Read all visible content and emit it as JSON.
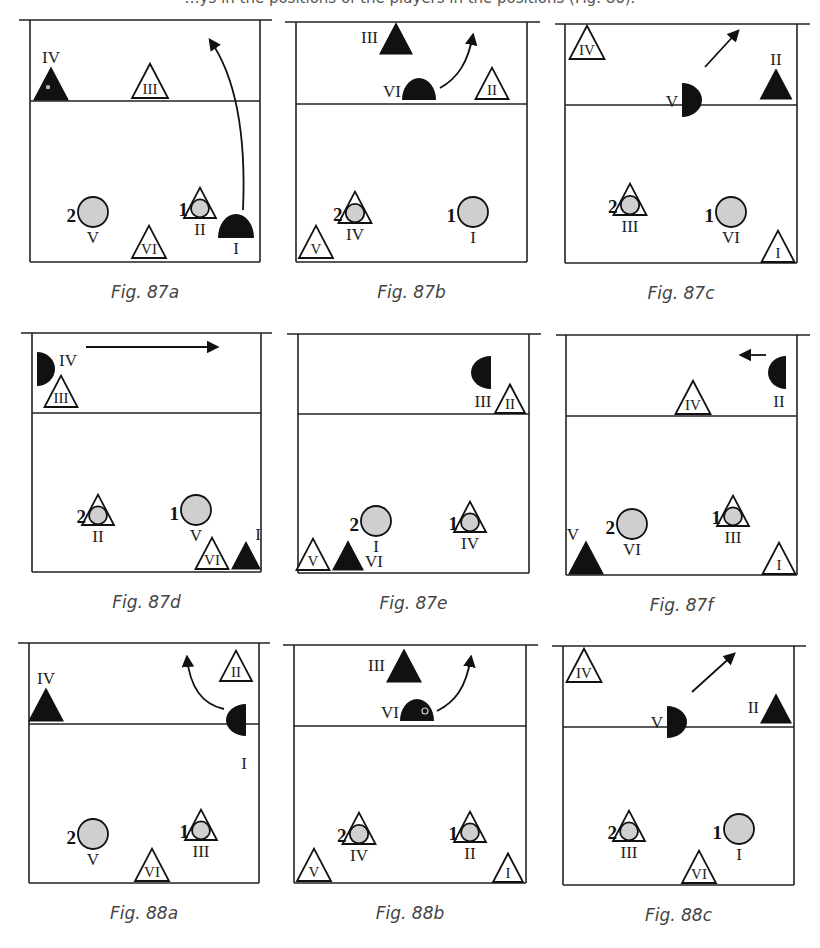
{
  "top_text": "…ys in the positions of the players in the positions (Fig. 86).",
  "colors": {
    "line": "#222222",
    "solid": "#111111",
    "ball": "#cfcfcf",
    "caption": "#444444"
  },
  "figures": [
    {
      "id": "87a",
      "caption": "Fig. 87a",
      "frame": {
        "x1": 30,
        "x2": 260,
        "top": 20,
        "net": 101,
        "bottom": 262,
        "ext_l": 19,
        "ext_r": 272
      },
      "items": [
        {
          "type": "tri-solid",
          "x": 51,
          "y": 100,
          "size": 34,
          "label": "IV",
          "label_pos": "above",
          "dot": true
        },
        {
          "type": "tri-open",
          "x": 150,
          "y": 98,
          "size": 36,
          "label": "III",
          "label_pos": "inside"
        },
        {
          "type": "ball",
          "x": 93,
          "y": 212,
          "r": 15,
          "num": "2",
          "label": "V"
        },
        {
          "type": "tri-open",
          "x": 149,
          "y": 258,
          "size": 34,
          "label": "VI",
          "label_pos": "inside"
        },
        {
          "type": "tri-ball",
          "x": 200,
          "y": 218,
          "size": 32,
          "num": "1",
          "label": "II"
        },
        {
          "type": "dome-up",
          "x": 236,
          "y": 238,
          "w": 36,
          "h": 24,
          "label": "I",
          "label_pos": "below"
        }
      ],
      "arrows": [
        {
          "d": "M243,210 C246,140 238,80 210,40",
          "head": [
            210,
            40
          ]
        }
      ]
    },
    {
      "id": "87b",
      "caption": "Fig. 87b",
      "frame": {
        "x1": 296,
        "x2": 527,
        "top": 22,
        "net": 104,
        "bottom": 262,
        "ext_l": 285,
        "ext_r": 540
      },
      "items": [
        {
          "type": "tri-solid",
          "x": 396,
          "y": 54,
          "size": 32,
          "label": "III",
          "label_pos": "left"
        },
        {
          "type": "dome-up",
          "x": 419,
          "y": 100,
          "w": 34,
          "h": 22,
          "label": "VI",
          "label_pos": "left"
        },
        {
          "type": "tri-open",
          "x": 492,
          "y": 99,
          "size": 33,
          "label": "II",
          "label_pos": "inside"
        },
        {
          "type": "tri-ball",
          "x": 355,
          "y": 223,
          "size": 33,
          "num": "2",
          "label": "IV"
        },
        {
          "type": "ball",
          "x": 473,
          "y": 212,
          "r": 15,
          "num": "1",
          "label": "I"
        },
        {
          "type": "tri-open",
          "x": 316,
          "y": 258,
          "size": 34,
          "label": "V",
          "label_pos": "inside"
        }
      ],
      "arrows": [
        {
          "d": "M440,88 C458,78 468,62 473,35",
          "head": [
            473,
            35
          ]
        }
      ]
    },
    {
      "id": "87c",
      "caption": "Fig. 87c",
      "frame": {
        "x1": 565,
        "x2": 797,
        "top": 24,
        "net": 105,
        "bottom": 263,
        "ext_l": 555,
        "ext_r": 810
      },
      "items": [
        {
          "type": "tri-open",
          "x": 587,
          "y": 59,
          "size": 35,
          "label": "IV",
          "label_pos": "inside"
        },
        {
          "type": "dome-right",
          "x": 682,
          "y": 83,
          "w": 20,
          "h": 34,
          "label": "V",
          "label_pos": "left"
        },
        {
          "type": "tri-solid",
          "x": 776,
          "y": 99,
          "size": 31,
          "label": "II",
          "label_pos": "above"
        },
        {
          "type": "tri-ball",
          "x": 630,
          "y": 215,
          "size": 33,
          "num": "2",
          "label": "III"
        },
        {
          "type": "ball",
          "x": 731,
          "y": 212,
          "r": 15,
          "num": "1",
          "label": "VI"
        },
        {
          "type": "tri-open",
          "x": 778,
          "y": 262,
          "size": 33,
          "label": "I",
          "label_pos": "inside"
        }
      ],
      "arrows": [
        {
          "d": "M705,67 L738,31",
          "head": [
            738,
            31
          ]
        }
      ]
    },
    {
      "id": "87d",
      "caption": "Fig. 87d",
      "frame": {
        "x1": 32,
        "x2": 261,
        "top": 333,
        "net": 413,
        "bottom": 572,
        "ext_l": 21,
        "ext_r": 272
      },
      "items": [
        {
          "type": "dome-right",
          "x": 37,
          "y": 352,
          "w": 18,
          "h": 34,
          "label": "IV",
          "label_pos": "right"
        },
        {
          "type": "tri-open",
          "x": 61,
          "y": 407,
          "size": 33,
          "label": "III",
          "label_pos": "inside"
        },
        {
          "type": "tri-ball",
          "x": 98,
          "y": 525,
          "size": 32,
          "num": "2",
          "label": "II"
        },
        {
          "type": "ball",
          "x": 196,
          "y": 510,
          "r": 15,
          "num": "1",
          "label": "V"
        },
        {
          "type": "tri-open",
          "x": 212,
          "y": 569,
          "size": 33,
          "label": "VI",
          "label_pos": "inside"
        },
        {
          "type": "tri-solid",
          "x": 246,
          "y": 569,
          "size": 28,
          "label": "I",
          "label_pos": "above-right"
        }
      ],
      "arrows": [
        {
          "d": "M86,347 L217,347",
          "head": [
            217,
            347
          ]
        }
      ]
    },
    {
      "id": "87e",
      "caption": "Fig. 87e",
      "frame": {
        "x1": 298,
        "x2": 529,
        "top": 334,
        "net": 414,
        "bottom": 573,
        "ext_l": 287,
        "ext_r": 541
      },
      "items": [
        {
          "type": "dome-left",
          "x": 491,
          "y": 356,
          "w": 20,
          "h": 33,
          "label": "III",
          "label_pos": "below"
        },
        {
          "type": "tri-open",
          "x": 510,
          "y": 413,
          "size": 30,
          "label": "II",
          "label_pos": "inside"
        },
        {
          "type": "ball",
          "x": 376,
          "y": 521,
          "r": 15,
          "num": "2",
          "label": "I"
        },
        {
          "type": "tri-ball",
          "x": 470,
          "y": 532,
          "size": 32,
          "num": "1",
          "label": "IV"
        },
        {
          "type": "tri-open",
          "x": 313,
          "y": 570,
          "size": 33,
          "label": "V",
          "label_pos": "inside"
        },
        {
          "type": "tri-solid",
          "x": 348,
          "y": 570,
          "size": 30,
          "label": "VI",
          "label_pos": "right"
        }
      ],
      "arrows": []
    },
    {
      "id": "87f",
      "caption": "Fig. 87f",
      "frame": {
        "x1": 566,
        "x2": 797,
        "top": 335,
        "net": 416,
        "bottom": 575,
        "ext_l": 556,
        "ext_r": 810
      },
      "items": [
        {
          "type": "dome-left",
          "x": 786,
          "y": 356,
          "w": 18,
          "h": 33,
          "label": "II",
          "label_pos": "below"
        },
        {
          "type": "tri-open",
          "x": 693,
          "y": 414,
          "size": 35,
          "label": "IV",
          "label_pos": "inside"
        },
        {
          "type": "ball",
          "x": 632,
          "y": 524,
          "r": 15,
          "num": "2",
          "label": "VI"
        },
        {
          "type": "tri-ball",
          "x": 733,
          "y": 526,
          "size": 32,
          "num": "1",
          "label": "III"
        },
        {
          "type": "tri-solid",
          "x": 586,
          "y": 574,
          "size": 34,
          "label": "V",
          "label_pos": "above-left"
        },
        {
          "type": "tri-open",
          "x": 779,
          "y": 574,
          "size": 33,
          "label": "I",
          "label_pos": "inside"
        }
      ],
      "arrows": [
        {
          "d": "M766,355 L741,355",
          "head": [
            741,
            355
          ]
        }
      ]
    },
    {
      "id": "88a",
      "caption": "Fig. 88a",
      "frame": {
        "x1": 29,
        "x2": 259,
        "top": 643,
        "net": 724,
        "bottom": 883,
        "ext_l": 18,
        "ext_r": 270
      },
      "items": [
        {
          "type": "tri-solid",
          "x": 46,
          "y": 721,
          "size": 34,
          "label": "IV",
          "label_pos": "above"
        },
        {
          "type": "tri-open",
          "x": 236,
          "y": 681,
          "size": 32,
          "label": "II",
          "label_pos": "inside"
        },
        {
          "type": "dome-left",
          "x": 246,
          "y": 704,
          "w": 20,
          "h": 32,
          "label": "I",
          "label_pos": "below-far"
        },
        {
          "type": "ball",
          "x": 93,
          "y": 834,
          "r": 15,
          "num": "2",
          "label": "V"
        },
        {
          "type": "tri-ball",
          "x": 201,
          "y": 840,
          "size": 32,
          "num": "1",
          "label": "III"
        },
        {
          "type": "tri-open",
          "x": 152,
          "y": 881,
          "size": 34,
          "label": "VI",
          "label_pos": "inside"
        }
      ],
      "arrows": [
        {
          "d": "M224,709 C205,705 190,690 187,657",
          "head": [
            187,
            657
          ]
        }
      ]
    },
    {
      "id": "88b",
      "caption": "Fig. 88b",
      "frame": {
        "x1": 294,
        "x2": 526,
        "top": 645,
        "net": 726,
        "bottom": 883,
        "ext_l": 283,
        "ext_r": 538
      },
      "items": [
        {
          "type": "tri-solid",
          "x": 404,
          "y": 682,
          "size": 34,
          "label": "III",
          "label_pos": "left"
        },
        {
          "type": "dome-up",
          "x": 417,
          "y": 721,
          "w": 34,
          "h": 22,
          "label": "VI",
          "label_pos": "left",
          "dot": true
        },
        {
          "type": "tri-ball",
          "x": 359,
          "y": 844,
          "size": 33,
          "num": "2",
          "label": "IV"
        },
        {
          "type": "tri-ball",
          "x": 470,
          "y": 842,
          "size": 32,
          "num": "1",
          "label": "II"
        },
        {
          "type": "tri-open",
          "x": 314,
          "y": 881,
          "size": 34,
          "label": "V",
          "label_pos": "inside"
        },
        {
          "type": "tri-open",
          "x": 508,
          "y": 882,
          "size": 30,
          "label": "I",
          "label_pos": "inside"
        }
      ],
      "arrows": [
        {
          "d": "M437,711 C455,702 466,688 471,657",
          "head": [
            471,
            657
          ]
        }
      ]
    },
    {
      "id": "88c",
      "caption": "Fig. 88c",
      "frame": {
        "x1": 563,
        "x2": 794,
        "top": 646,
        "net": 727,
        "bottom": 885,
        "ext_l": 552,
        "ext_r": 806
      },
      "items": [
        {
          "type": "tri-open",
          "x": 584,
          "y": 682,
          "size": 35,
          "label": "IV",
          "label_pos": "inside"
        },
        {
          "type": "dome-right",
          "x": 667,
          "y": 706,
          "w": 20,
          "h": 32,
          "label": "V",
          "label_pos": "left"
        },
        {
          "type": "tri-solid",
          "x": 776,
          "y": 723,
          "size": 30,
          "label": "II",
          "label_pos": "left"
        },
        {
          "type": "tri-ball",
          "x": 629,
          "y": 841,
          "size": 32,
          "num": "2",
          "label": "III"
        },
        {
          "type": "ball",
          "x": 739,
          "y": 829,
          "r": 15,
          "num": "1",
          "label": "I"
        },
        {
          "type": "tri-open",
          "x": 699,
          "y": 883,
          "size": 34,
          "label": "VI",
          "label_pos": "inside"
        }
      ],
      "arrows": [
        {
          "d": "M692,692 L734,654",
          "head": [
            734,
            654
          ]
        }
      ]
    }
  ],
  "caption_offset": 36
}
